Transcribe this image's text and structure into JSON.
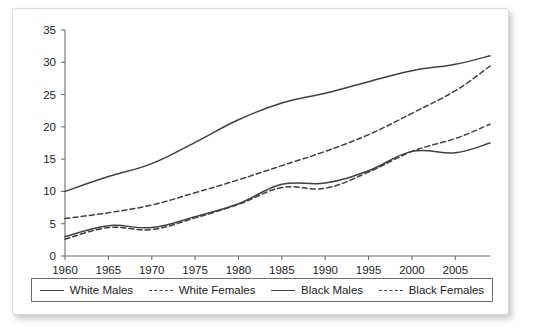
{
  "chart_data": {
    "type": "line",
    "title": "",
    "subtitle": "",
    "xlabel": "",
    "ylabel": "",
    "xlim": [
      1960,
      2009
    ],
    "ylim": [
      0,
      35
    ],
    "grid": false,
    "legend_position": "bottom",
    "x_ticks": [
      "1960",
      "1965",
      "1970",
      "1975",
      "1980",
      "1985",
      "1990",
      "1995",
      "2000",
      "2005"
    ],
    "y_ticks": [
      "0",
      "5",
      "10",
      "15",
      "20",
      "25",
      "30",
      "35"
    ],
    "x": [
      1960,
      1965,
      1970,
      1975,
      1980,
      1985,
      1990,
      1995,
      2000,
      2005,
      2009
    ],
    "series": [
      {
        "name": "White Males",
        "style": "solid",
        "color": "#414141",
        "values": [
          10.0,
          12.3,
          14.3,
          17.6,
          21.1,
          23.7,
          25.2,
          27.0,
          28.7,
          29.7,
          31.0
        ]
      },
      {
        "name": "White Females",
        "style": "dashed",
        "color": "#414141",
        "values": [
          5.8,
          6.7,
          7.9,
          9.8,
          11.8,
          14.0,
          16.2,
          18.8,
          22.1,
          25.6,
          29.4
        ]
      },
      {
        "name": "Black Males",
        "style": "solid",
        "color": "#414141",
        "values": [
          3.0,
          4.7,
          4.4,
          6.1,
          8.1,
          11.1,
          11.3,
          13.2,
          16.2,
          16.0,
          17.5
        ]
      },
      {
        "name": "Black Females",
        "style": "dashed",
        "color": "#414141",
        "values": [
          2.6,
          4.4,
          4.1,
          5.9,
          8.0,
          10.6,
          10.5,
          13.0,
          16.2,
          18.2,
          20.4
        ]
      }
    ]
  },
  "legend": {
    "entries": [
      {
        "label": "White Males",
        "style": "solid"
      },
      {
        "label": "White Females",
        "style": "dashed"
      },
      {
        "label": "Black Males",
        "style": "solid"
      },
      {
        "label": "Black Females",
        "style": "dashed"
      }
    ]
  }
}
